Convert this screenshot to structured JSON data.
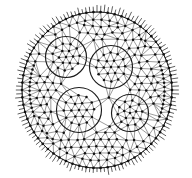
{
  "figure": {
    "type": "finite-element-mesh",
    "title": "Triangular mesh on elliptical domain with four circular inclusions",
    "background_color": "#ffffff",
    "ink_color": "#1a1a1a",
    "edge_color": "#4a4a4a",
    "node_color": "#111111",
    "canvas": {
      "width": 192,
      "height": 178
    }
  },
  "chart_data": {
    "type": "diagram",
    "title": "Triangular mesh on elliptical domain with four circular inclusions",
    "xlabel": "",
    "ylabel": "",
    "grid": false,
    "legend": "none",
    "outer_boundary": {
      "shape": "ellipse",
      "center_x": 97,
      "center_y": 90,
      "radius_x": 75,
      "radius_y": 78,
      "stroke_width": 1.0,
      "spike_count": 132,
      "spike_length": 5.5,
      "label": "outer elliptical boundary with radial boundary spikes"
    },
    "inner_circles": [
      {
        "name": "upper-left-hole",
        "center_x": 66,
        "center_y": 57,
        "radius": 20.5
      },
      {
        "name": "upper-right-hole",
        "center_x": 111,
        "center_y": 67,
        "radius": 21.5
      },
      {
        "name": "lower-left-hole",
        "center_x": 79,
        "center_y": 110,
        "radius": 22.5
      },
      {
        "name": "lower-right-hole",
        "center_x": 130,
        "center_y": 113,
        "radius": 18.5
      }
    ],
    "mesh": {
      "element_type": "triangle",
      "target_edge_length": 8.2,
      "node_radius": 1.25,
      "refinement": "refined along outer ellipse and circle boundaries",
      "approx_node_count": 700,
      "approx_edge_count": 2000
    }
  }
}
